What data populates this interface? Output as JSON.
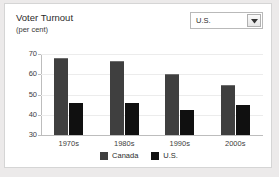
{
  "header": {
    "title": "Voter Turnout",
    "subtitle": "(per cent)"
  },
  "region_select": {
    "value": "U.S.",
    "icon": "dropdown-arrow-icon"
  },
  "chart_data": {
    "type": "bar",
    "title": "Voter Turnout",
    "subtitle": "(per cent)",
    "xlabel": "",
    "ylabel": "per cent",
    "ylim": [
      30,
      70
    ],
    "yticks": [
      30,
      40,
      50,
      60,
      70
    ],
    "ytick_labels": [
      "30",
      "40",
      "50",
      "60",
      "70"
    ],
    "grid": true,
    "legend_position": "bottom",
    "categories": [
      "1970s",
      "1980s",
      "1990s",
      "2000s"
    ],
    "series": [
      {
        "name": "Canada",
        "color": "#3f3f3f",
        "values": [
          68,
          66.5,
          60.2,
          54.6
        ]
      },
      {
        "name": "U.S.",
        "color": "#101010",
        "values": [
          46,
          46,
          42.4,
          45
        ]
      }
    ]
  }
}
